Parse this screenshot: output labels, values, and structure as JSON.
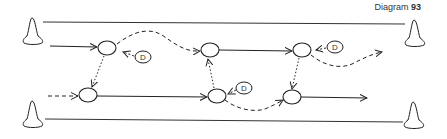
{
  "title": {
    "label": "Diagram",
    "number": "93"
  },
  "defender_label": "D",
  "colors": {
    "ink": "#222222",
    "background": "#ffffff"
  },
  "elements": {
    "cones": [
      "top-left",
      "bottom-left",
      "top-right",
      "bottom-right"
    ],
    "players": 6,
    "defenders": 3
  }
}
